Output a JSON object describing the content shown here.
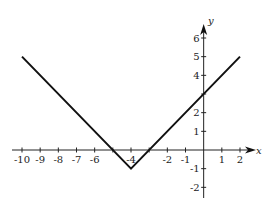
{
  "chart_data": {
    "type": "line",
    "title": "",
    "function": "y = |x + 4| - 1",
    "xlabel": "x",
    "ylabel": "y",
    "xlim": [
      -10,
      2
    ],
    "ylim": [
      -2,
      6
    ],
    "grid": false,
    "legend": null,
    "x_ticks": [
      -10,
      -9,
      -8,
      -7,
      -6,
      -5,
      -4,
      -3,
      -2,
      -1,
      0,
      1,
      2
    ],
    "x_tick_labels": [
      "-10",
      "-9",
      "-8",
      "-7",
      "-6",
      "",
      "-4",
      "",
      "-2",
      "-1",
      "",
      "1",
      "2"
    ],
    "y_ticks": [
      -2,
      -1,
      0,
      1,
      2,
      3,
      4,
      5,
      6
    ],
    "y_tick_labels": [
      "-2",
      "-1",
      "",
      "1",
      "2",
      "",
      "4",
      "5",
      "6"
    ],
    "series": [
      {
        "name": "y = |x+4| - 1",
        "x": [
          -10,
          -4,
          2
        ],
        "y": [
          5,
          -1,
          5
        ],
        "color": "#111111"
      }
    ],
    "key_points": {
      "vertex": [
        -4,
        -1
      ],
      "x_intercepts": [
        -5,
        -3
      ],
      "y_intercept": 3
    }
  },
  "axes": {
    "x_label": "x",
    "y_label": "y"
  }
}
